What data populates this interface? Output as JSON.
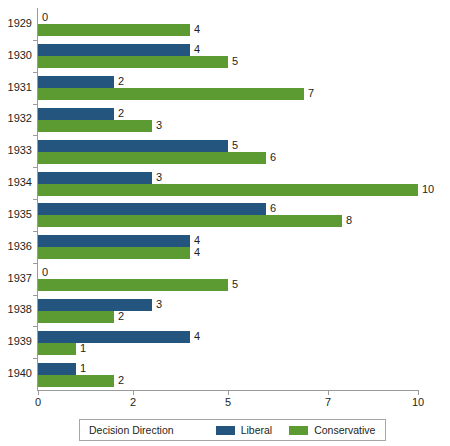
{
  "chart_data": {
    "type": "bar",
    "orientation": "horizontal",
    "title": "",
    "xlabel": "",
    "ylabel": "",
    "categories": [
      "1929",
      "1930",
      "1931",
      "1932",
      "1933",
      "1934",
      "1935",
      "1936",
      "1937",
      "1938",
      "1939",
      "1940"
    ],
    "series": [
      {
        "name": "Liberal",
        "color": "#24557f",
        "values": [
          0,
          4,
          2,
          2,
          5,
          3,
          6,
          4,
          0,
          3,
          4,
          1
        ]
      },
      {
        "name": "Conservative",
        "color": "#5b9b32",
        "values": [
          4,
          5,
          7,
          3,
          6,
          10,
          8,
          4,
          5,
          2,
          1,
          2
        ]
      }
    ],
    "x_ticks": [
      0,
      2,
      5,
      7,
      10
    ],
    "x_tick_labels": [
      "0",
      "2",
      "5",
      "7",
      "10"
    ],
    "xlim": [
      0,
      10
    ],
    "grid": false,
    "legend_position": "bottom",
    "legend_title": "Decision Direction",
    "data_labels": true
  }
}
